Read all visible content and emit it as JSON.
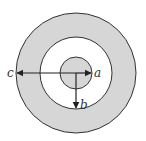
{
  "diagram": {
    "colors": {
      "shell_fill": "#d6d6d6",
      "gap_fill": "#ffffff",
      "core_fill": "#d6d6d6",
      "stroke": "#333333"
    },
    "labels": {
      "a": "a",
      "b": "b",
      "c": "c"
    }
  }
}
